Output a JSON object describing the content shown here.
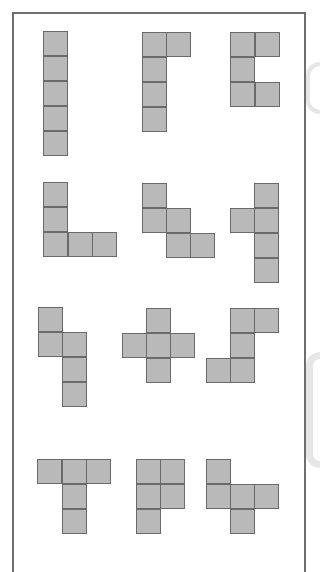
{
  "diagram": {
    "title": "",
    "cell_size": 25,
    "colors": {
      "cell_fill": "#b9b9b9",
      "cell_border": "#6a6a6a",
      "frame_border": "#6e6e6e",
      "background": "#ffffff"
    },
    "pieces": [
      {
        "name": "I-pentomino",
        "cells": [
          [
            43,
            31
          ],
          [
            43,
            56
          ],
          [
            43,
            81
          ],
          [
            43,
            106
          ],
          [
            43,
            131
          ]
        ]
      },
      {
        "name": "L-pentomino-flipped",
        "cells": [
          [
            142,
            32
          ],
          [
            166,
            32
          ],
          [
            142,
            57
          ],
          [
            142,
            82
          ],
          [
            142,
            107
          ]
        ]
      },
      {
        "name": "U-pentomino",
        "cells": [
          [
            230,
            32
          ],
          [
            255,
            32
          ],
          [
            230,
            57
          ],
          [
            230,
            82
          ],
          [
            255,
            82
          ]
        ]
      },
      {
        "name": "V-pentomino",
        "cells": [
          [
            43,
            182
          ],
          [
            43,
            207
          ],
          [
            43,
            232
          ],
          [
            68,
            232
          ],
          [
            92,
            232
          ]
        ]
      },
      {
        "name": "W-pentomino",
        "cells": [
          [
            142,
            183
          ],
          [
            142,
            208
          ],
          [
            166,
            208
          ],
          [
            166,
            233
          ],
          [
            190,
            233
          ]
        ]
      },
      {
        "name": "Y-pentomino",
        "cells": [
          [
            254,
            183
          ],
          [
            230,
            208
          ],
          [
            254,
            208
          ],
          [
            254,
            233
          ],
          [
            254,
            258
          ]
        ]
      },
      {
        "name": "N-pentomino",
        "cells": [
          [
            38,
            307
          ],
          [
            38,
            332
          ],
          [
            62,
            332
          ],
          [
            62,
            357
          ],
          [
            62,
            382
          ]
        ]
      },
      {
        "name": "X-pentomino",
        "cells": [
          [
            146,
            308
          ],
          [
            122,
            333
          ],
          [
            146,
            333
          ],
          [
            170,
            333
          ],
          [
            146,
            358
          ]
        ]
      },
      {
        "name": "F-pentomino",
        "cells": [
          [
            230,
            308
          ],
          [
            254,
            308
          ],
          [
            230,
            333
          ],
          [
            206,
            358
          ],
          [
            230,
            358
          ]
        ]
      },
      {
        "name": "T-pentomino",
        "cells": [
          [
            37,
            459
          ],
          [
            62,
            459
          ],
          [
            86,
            459
          ],
          [
            62,
            484
          ],
          [
            62,
            509
          ]
        ]
      },
      {
        "name": "P-pentomino",
        "cells": [
          [
            136,
            459
          ],
          [
            160,
            459
          ],
          [
            136,
            484
          ],
          [
            160,
            484
          ],
          [
            136,
            509
          ]
        ]
      },
      {
        "name": "F-pentomino-variant",
        "cells": [
          [
            206,
            459
          ],
          [
            206,
            484
          ],
          [
            230,
            484
          ],
          [
            254,
            484
          ],
          [
            230,
            509
          ]
        ]
      }
    ]
  }
}
